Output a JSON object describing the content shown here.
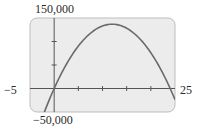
{
  "chart_data": {
    "type": "line",
    "title": "",
    "xlabel": "",
    "ylabel": "",
    "xlim": [
      -5,
      25
    ],
    "ylim": [
      -50000,
      150000
    ],
    "x_tick_step": 5,
    "y_tick_step": 50000,
    "window_labels": {
      "xmin": "−5",
      "xmax": "25",
      "ymin": "−50,000",
      "ymax": "150,000"
    },
    "grid": false,
    "legend": null,
    "series": [
      {
        "name": "parabola",
        "description": "Downward-opening parabola with roots near x=0 and x≈24, vertex near (12, 137000)",
        "x": [
          -3,
          0,
          3,
          6,
          9,
          12,
          15,
          18,
          21,
          24,
          25
        ],
        "values": [
          -76950,
          0,
          59850,
          102600,
          128250,
          136800,
          128250,
          102600,
          59850,
          0,
          -23750
        ]
      }
    ]
  },
  "colors": {
    "plot_background": "#ececec",
    "plot_border": "#bdbdbd",
    "axis": "#555555",
    "curve": "#6a6a6a"
  }
}
